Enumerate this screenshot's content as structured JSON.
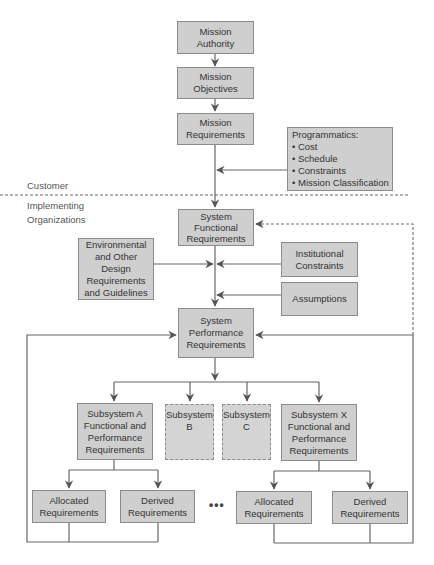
{
  "diagram": {
    "nodes": {
      "mission_authority": "Mission\nAuthority",
      "mission_objectives": "Mission\nObjectives",
      "mission_requirements": "Mission\nRequirements",
      "programmatics": "Programmatics:\n• Cost\n• Schedule\n• Constraints\n• Mission Classification",
      "system_functional": "System\nFunctional\nRequirements",
      "environmental": "Environmental\nand Other Design\nRequirements\nand Guidelines",
      "institutional": "Institutional\nConstraints",
      "assumptions": "Assumptions",
      "system_performance": "System\nPerformance\nRequirements",
      "subsystem_a": "Subsystem A\nFunctional and\nPerformance\nRequirements",
      "subsystem_b": "Subsystem\nB",
      "subsystem_c": "Subsystem\nC",
      "subsystem_x": "Subsystem X\nFunctional and\nPerformance\nRequirements",
      "allocated_a": "Allocated\nRequirements",
      "derived_a": "Derived\nRequirements",
      "allocated_x": "Allocated\nRequirements",
      "derived_x": "Derived\nRequirements"
    },
    "boundary_labels": {
      "customer": "Customer",
      "implementing": "Implementing\nOrganizations"
    },
    "ellipsis": "•••",
    "colors": {
      "box_fill": "#cfcfcf",
      "box_border": "#8c8c8c",
      "line": "#555555"
    }
  }
}
